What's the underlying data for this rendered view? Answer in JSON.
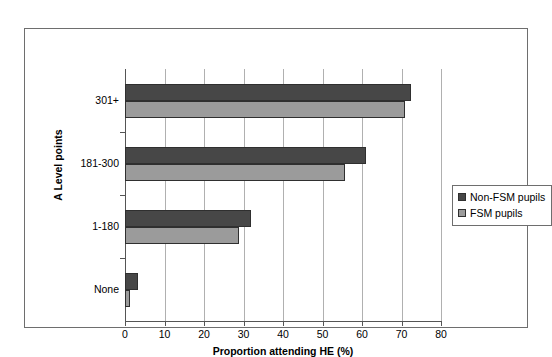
{
  "chart_data": {
    "type": "bar",
    "orientation": "horizontal",
    "title": "",
    "xlabel": "Proportion attending HE (%)",
    "ylabel": "A Level points",
    "categories": [
      "None",
      "1-180",
      "181-300",
      "301+"
    ],
    "categories_top_to_bottom": [
      "301+",
      "181-300",
      "1-180",
      "None"
    ],
    "series": [
      {
        "name": "Non-FSM pupils",
        "color": "#474747",
        "values": [
          3.3,
          32.0,
          61.0,
          72.5
        ]
      },
      {
        "name": "FSM pupils",
        "color": "#9b9b9b",
        "values": [
          1.3,
          28.8,
          55.8,
          71.0
        ]
      }
    ],
    "xlim": [
      0,
      80
    ],
    "xticks": [
      0,
      10,
      20,
      30,
      40,
      50,
      60,
      70,
      80
    ],
    "xtick_labels": [
      "0",
      "10",
      "20",
      "30",
      "40",
      "50",
      "60",
      "70",
      "80"
    ],
    "grid": "vertical",
    "legend_position": "right",
    "legend_entries": [
      "Non-FSM pupils",
      "FSM pupils"
    ]
  },
  "legend": {
    "items": [
      {
        "label": "Non-FSM pupils",
        "swatch": "legend-swatch-non-fsm",
        "color": "#474747"
      },
      {
        "label": "FSM pupils",
        "swatch": "legend-swatch-fsm",
        "color": "#9b9b9b"
      }
    ]
  },
  "axes": {
    "x_title": "Proportion attending HE (%)",
    "y_title": "A Level points"
  }
}
